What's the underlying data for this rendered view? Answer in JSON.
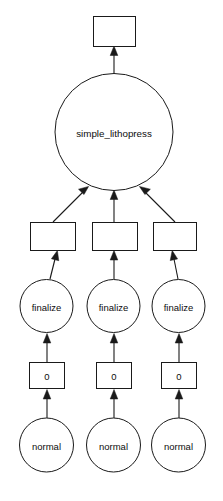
{
  "diagram": {
    "type": "directed-graph",
    "title_node": "simple_lithopress",
    "background_color": "#ffffff",
    "stroke_color": "#1a1a1a",
    "text_color": "#0d0d0d",
    "nodes": {
      "top_box": {
        "label": "",
        "shape": "rectangle"
      },
      "root_circle": {
        "label": "simple_lithopress",
        "shape": "ellipse"
      },
      "mid_box_left": {
        "label": "",
        "shape": "rectangle"
      },
      "mid_box_center": {
        "label": "",
        "shape": "rectangle"
      },
      "mid_box_right": {
        "label": "",
        "shape": "rectangle"
      },
      "finalize_left": {
        "label": "finalize",
        "shape": "ellipse"
      },
      "finalize_center": {
        "label": "finalize",
        "shape": "ellipse"
      },
      "finalize_right": {
        "label": "finalize",
        "shape": "ellipse"
      },
      "zero_box_left": {
        "label": "0",
        "shape": "rectangle"
      },
      "zero_box_center": {
        "label": "0",
        "shape": "rectangle"
      },
      "zero_box_right": {
        "label": "0",
        "shape": "rectangle"
      },
      "normal_left": {
        "label": "normal",
        "shape": "ellipse"
      },
      "normal_center": {
        "label": "normal",
        "shape": "ellipse"
      },
      "normal_right": {
        "label": "normal",
        "shape": "ellipse"
      }
    }
  }
}
